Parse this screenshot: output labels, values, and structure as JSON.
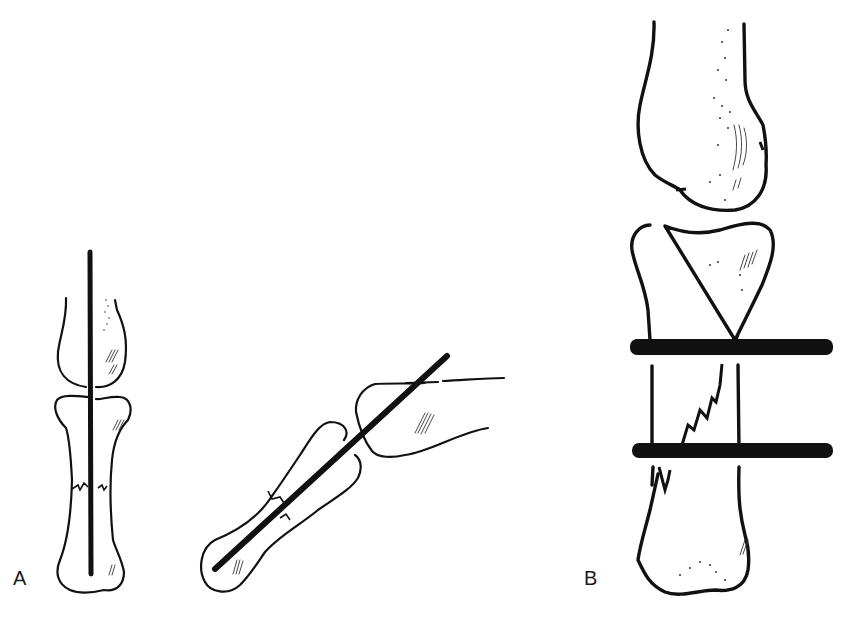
{
  "figure": {
    "panels": [
      {
        "id": "A",
        "label": "A",
        "views": [
          "frontal view of finger phalanx with longitudinal K-wire",
          "lateral view with oblique longitudinal K-wire across joint"
        ]
      },
      {
        "id": "B",
        "label": "B",
        "views": [
          "frontal view of oblique phalangeal fracture fixed with two transverse K-wires"
        ]
      }
    ]
  },
  "colors": {
    "background": "#ffffff",
    "ink": "#111111"
  }
}
